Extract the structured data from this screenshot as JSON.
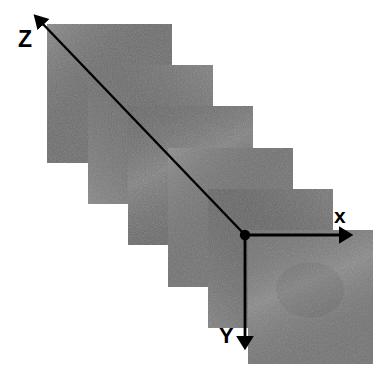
{
  "figure": {
    "width": 390,
    "height": 383,
    "background_color": "#ffffff"
  },
  "axes": {
    "origin": {
      "x": 245,
      "y": 235,
      "dot_radius": 5,
      "color": "#000000"
    },
    "labels": {
      "x": "x",
      "y": "Y",
      "z": "Z"
    },
    "x_axis": {
      "label": "x",
      "from": {
        "x": 245,
        "y": 235
      },
      "to": {
        "x": 350,
        "y": 235
      },
      "direction": "right",
      "color": "#000000",
      "stroke_width": 2.6,
      "arrowhead": true,
      "label_position": {
        "x": 334,
        "y": 205
      }
    },
    "y_axis": {
      "label": "Y",
      "from": {
        "x": 245,
        "y": 235
      },
      "to": {
        "x": 245,
        "y": 348
      },
      "direction": "down",
      "color": "#000000",
      "stroke_width": 2.6,
      "arrowhead": true,
      "label_position": {
        "x": 219,
        "y": 325
      }
    },
    "z_axis": {
      "label": "Z",
      "from": {
        "x": 245,
        "y": 235
      },
      "to": {
        "x": 38,
        "y": 19
      },
      "direction": "up-left-diagonal",
      "color": "#000000",
      "stroke_width": 2.4,
      "arrowhead": true,
      "label_position": {
        "x": 18,
        "y": 28
      }
    }
  },
  "slices": {
    "count": 6,
    "description": "Six overlapping grayscale image planes stacked along the Z axis, each offset down and to the right",
    "slice_width": 124,
    "slice_height": 139,
    "step_x": 40.4,
    "step_y": 41.6,
    "border_color": "#ffffff",
    "items": [
      {
        "index": 1,
        "name": "slice-1-back",
        "x": 47,
        "y": 24,
        "width": 125,
        "height": 139,
        "gray": "#6f6f6f",
        "noise_seed": 11
      },
      {
        "index": 2,
        "name": "slice-2",
        "x": 88,
        "y": 65,
        "width": 125,
        "height": 139,
        "gray": "#737373",
        "noise_seed": 23
      },
      {
        "index": 3,
        "name": "slice-3",
        "x": 128,
        "y": 106,
        "width": 125,
        "height": 139,
        "gray": "#6d6d6d",
        "noise_seed": 37
      },
      {
        "index": 4,
        "name": "slice-4",
        "x": 168,
        "y": 148,
        "width": 125,
        "height": 139,
        "gray": "#757575",
        "noise_seed": 51
      },
      {
        "index": 5,
        "name": "slice-5",
        "x": 208,
        "y": 189,
        "width": 125,
        "height": 139,
        "gray": "#6b6b6b",
        "noise_seed": 67
      },
      {
        "index": 6,
        "name": "slice-6-front",
        "x": 248,
        "y": 230,
        "width": 125,
        "height": 134,
        "gray": "#787878",
        "noise_seed": 83
      }
    ]
  },
  "colors": {
    "ink": "#000000",
    "paper": "#ffffff",
    "slice_base_gray": "#717171"
  }
}
